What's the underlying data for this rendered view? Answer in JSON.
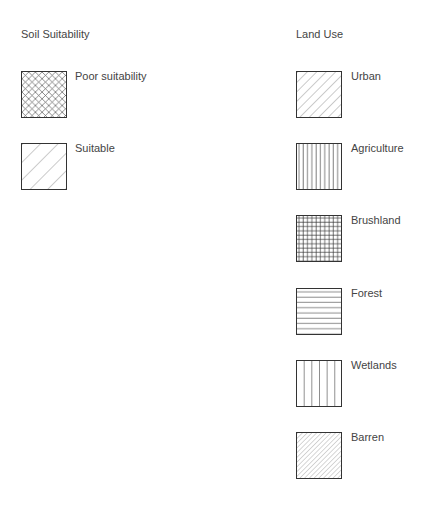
{
  "soil": {
    "title": "Soil Suitability",
    "items": [
      {
        "label": "Poor suitability",
        "pattern": "crosshatch-diagonal"
      },
      {
        "label": "Suitable",
        "pattern": "wide-diagonal"
      }
    ]
  },
  "landuse": {
    "title": "Land Use",
    "items": [
      {
        "label": "Urban",
        "pattern": "diagonal"
      },
      {
        "label": "Agriculture",
        "pattern": "vertical-dense"
      },
      {
        "label": "Brushland",
        "pattern": "grid"
      },
      {
        "label": "Forest",
        "pattern": "horizontal"
      },
      {
        "label": "Wetlands",
        "pattern": "vertical-wide"
      },
      {
        "label": "Barren",
        "pattern": "diagonal-dense"
      }
    ]
  }
}
